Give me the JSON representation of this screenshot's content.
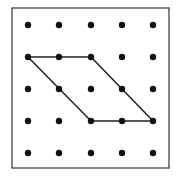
{
  "diagram": {
    "type": "dot-grid-geoboard",
    "grid": {
      "rows": 5,
      "cols": 5,
      "x": [
        28,
        59,
        91,
        122,
        153
      ],
      "y": [
        25,
        57,
        89,
        121,
        153
      ],
      "dot_radius": 3.2,
      "dot_color": "#111111"
    },
    "frame": {
      "x": 12,
      "y": 8,
      "width": 157,
      "height": 160,
      "stroke": "#444444"
    },
    "shape": {
      "name": "parallelogram",
      "stroke": "#222222",
      "vertices": [
        {
          "col": 0,
          "row": 1
        },
        {
          "col": 2,
          "row": 1
        },
        {
          "col": 4,
          "row": 3
        },
        {
          "col": 2,
          "row": 3
        }
      ]
    }
  }
}
